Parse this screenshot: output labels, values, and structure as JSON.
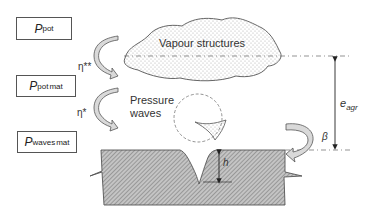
{
  "boxes": [
    {
      "id": "p-pot",
      "symbol": "P",
      "subscript": "pot",
      "superscript": ""
    },
    {
      "id": "p-pot-mat",
      "symbol": "P",
      "subscript": "pot",
      "superscript": "mat"
    },
    {
      "id": "p-waves-mat",
      "symbol": "P",
      "subscript": "waves",
      "superscript": "mat"
    }
  ],
  "efficiencies": {
    "eta_double_star": "η**",
    "eta_star": "η*"
  },
  "labels": {
    "vapour": "Vapour structures",
    "pressure_line1": "Pressure",
    "pressure_line2": "waves",
    "h": "h",
    "beta": "β",
    "e_symbol": "e",
    "e_sub": "agr"
  },
  "colors": {
    "stroke": "#555555",
    "arrow_fill": "#d9d9d9",
    "hatch": "#7a7a7a",
    "cloud_dot": "#9a9a9a"
  }
}
